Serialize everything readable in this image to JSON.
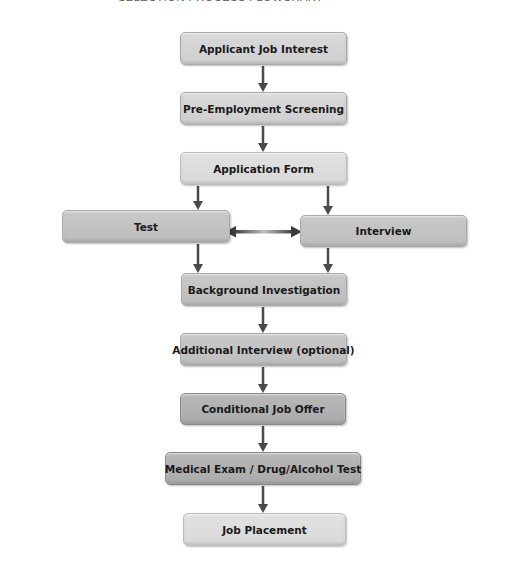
{
  "header": {
    "title_fragment": "SELECTION PROCESS FLOWCHART"
  },
  "flowchart": {
    "nodes": [
      {
        "id": "applicant",
        "label": "Applicant Job Interest"
      },
      {
        "id": "screening",
        "label": "Pre-Employment Screening"
      },
      {
        "id": "application",
        "label": "Application Form"
      },
      {
        "id": "test",
        "label": "Test"
      },
      {
        "id": "interview",
        "label": "Interview"
      },
      {
        "id": "background",
        "label": "Background Investigation"
      },
      {
        "id": "additional",
        "label": "Additional Interview (optional)"
      },
      {
        "id": "offer",
        "label": "Conditional Job Offer"
      },
      {
        "id": "medical",
        "label": "Medical Exam / Drug/Alcohol Test"
      },
      {
        "id": "placement",
        "label": "Job Placement"
      }
    ],
    "edges": [
      {
        "from": "applicant",
        "to": "screening"
      },
      {
        "from": "screening",
        "to": "application"
      },
      {
        "from": "application",
        "to": "test"
      },
      {
        "from": "application",
        "to": "interview"
      },
      {
        "from": "test",
        "to": "interview",
        "bidirectional": true
      },
      {
        "from": "test",
        "to": "background"
      },
      {
        "from": "interview",
        "to": "background"
      },
      {
        "from": "background",
        "to": "additional"
      },
      {
        "from": "additional",
        "to": "offer"
      },
      {
        "from": "offer",
        "to": "medical"
      },
      {
        "from": "medical",
        "to": "placement"
      }
    ],
    "colors": {
      "arrow": "#4a4a4a",
      "box_light": "#d4d4d4",
      "box_mid": "#c3c3c3",
      "box_dark": "#b0b0b0"
    }
  }
}
